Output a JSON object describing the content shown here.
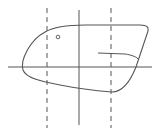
{
  "diagram": {
    "stroke_color": "#555555",
    "axes": {
      "horizontal": {
        "x1": 8,
        "y1": 67,
        "x2": 152,
        "y2": 67
      },
      "vertical": {
        "x1": 79,
        "y1": 10,
        "x2": 79,
        "y2": 125
      }
    },
    "dashed_lines": [
      {
        "x1": 47,
        "y1": 8,
        "x2": 47,
        "y2": 128
      },
      {
        "x1": 111,
        "y1": 8,
        "x2": 111,
        "y2": 128
      }
    ],
    "outline_path": "M 23 70 C 20 60, 30 40, 45 32 C 55 26, 70 25, 85 25 L 140 25 C 147 25, 150 27, 147 34 L 136 67 C 130 82, 122 92, 112 92 C 100 91, 80 89, 60 85 C 40 81, 26 78, 23 70 Z",
    "inner_line_path": "M 98 53 L 125 54 C 132 55, 137 57, 139 60",
    "marker_circle": {
      "cx": 58,
      "cy": 37,
      "r": 1.8
    }
  }
}
